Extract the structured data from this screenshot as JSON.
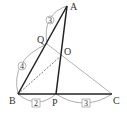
{
  "diagram": {
    "type": "triangle-geometry",
    "points": {
      "A": {
        "label": "A",
        "x": 67,
        "y": 6
      },
      "Q": {
        "label": "Q",
        "x": 47,
        "y": 44
      },
      "O": {
        "label": "O",
        "x": 62,
        "y": 55
      },
      "B": {
        "label": "B",
        "x": 18,
        "y": 94
      },
      "P": {
        "label": "P",
        "x": 56,
        "y": 94
      },
      "C": {
        "label": "C",
        "x": 112,
        "y": 94
      }
    },
    "segments": [
      {
        "from": "A",
        "to": "B",
        "style": "thick"
      },
      {
        "from": "A",
        "to": "P",
        "style": "thick"
      },
      {
        "from": "B",
        "to": "C",
        "style": "thick"
      },
      {
        "from": "Q",
        "to": "C",
        "style": "thin-gray"
      },
      {
        "from": "B",
        "to": "O",
        "style": "dashed"
      }
    ],
    "ratio_labels": {
      "AQ": {
        "value": "3",
        "shape": "circle"
      },
      "QB": {
        "value": "4",
        "shape": "circle"
      },
      "BP": {
        "value": "2",
        "shape": "square"
      },
      "PC": {
        "value": "3",
        "shape": "square"
      }
    },
    "colors": {
      "thick_line": "#222222",
      "thin_line": "#aaaaaa",
      "arc": "#999999",
      "text": "#333333"
    }
  }
}
